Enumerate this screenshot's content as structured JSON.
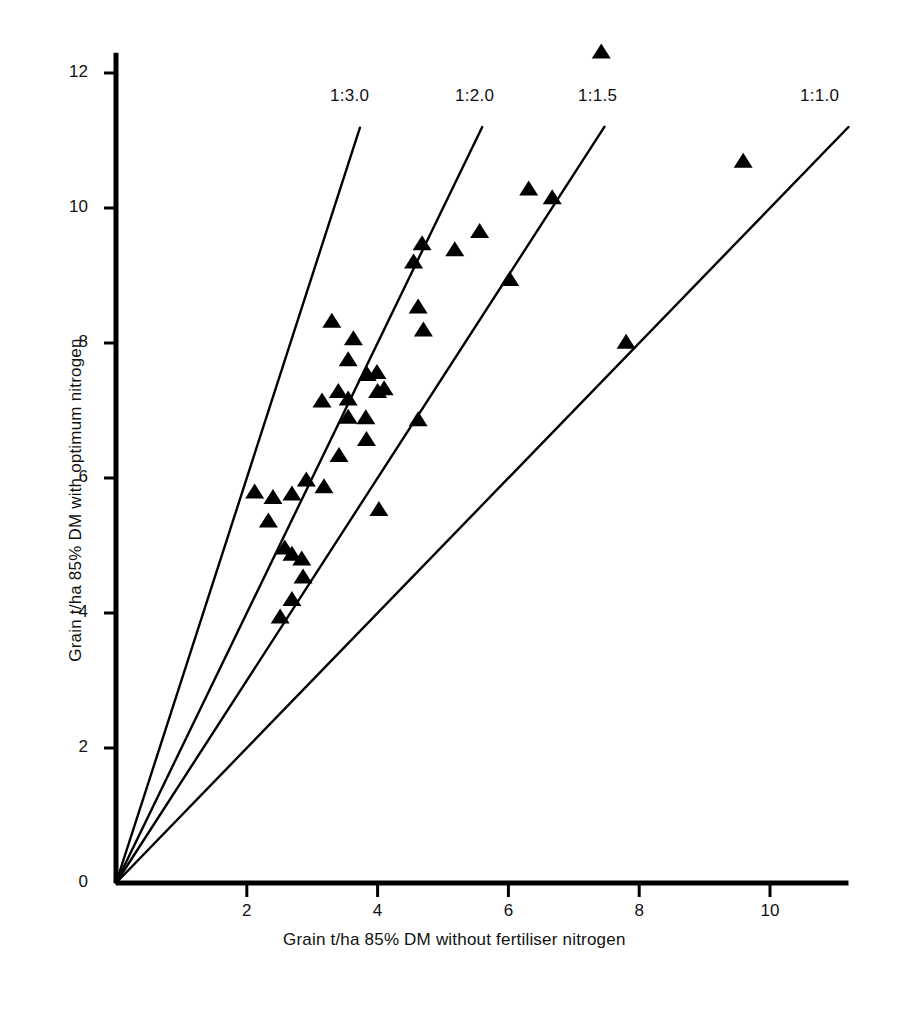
{
  "figure": {
    "background": "#ffffff",
    "ink_color": "#000000"
  },
  "axes": {
    "x_title": "Grain t/ha 85% DM without fertiliser nitrogen",
    "y_title": "Grain t/ha 85% DM with optimum nitrogen",
    "x_ticks": [
      "2",
      "4",
      "6",
      "8",
      "10"
    ],
    "y_ticks": [
      "0",
      "2",
      "4",
      "6",
      "8",
      "10",
      "12"
    ]
  },
  "ratio_labels": [
    {
      "text": "1:3.0",
      "x": 330,
      "y": 86
    },
    {
      "text": "1:2.0",
      "x": 455,
      "y": 86
    },
    {
      "text": "1:1.5",
      "x": 578,
      "y": 86
    },
    {
      "text": "1:1.0",
      "x": 800,
      "y": 86
    }
  ],
  "chart_data": {
    "type": "scatter",
    "title": "",
    "xlabel": "Grain t/ha 85% DM without fertiliser nitrogen",
    "ylabel": "Grain t/ha 85% DM with optimum nitrogen",
    "xlim": [
      0,
      11.2
    ],
    "ylim": [
      0,
      12.3
    ],
    "xticks": [
      2,
      4,
      6,
      8,
      10
    ],
    "yticks": [
      0,
      2,
      4,
      6,
      8,
      10,
      12
    ],
    "grid": false,
    "legend": "none",
    "marker": "triangle-up",
    "marker_color": "#000000",
    "series": [
      {
        "name": "sites",
        "points": [
          [
            7.42,
            12.3
          ],
          [
            9.59,
            10.68
          ],
          [
            6.31,
            10.27
          ],
          [
            6.67,
            10.14
          ],
          [
            4.68,
            9.46
          ],
          [
            5.18,
            9.37
          ],
          [
            5.56,
            9.64
          ],
          [
            4.55,
            9.19
          ],
          [
            6.02,
            8.93
          ],
          [
            4.62,
            8.52
          ],
          [
            4.7,
            8.18
          ],
          [
            3.3,
            8.31
          ],
          [
            3.63,
            8.05
          ],
          [
            3.55,
            7.74
          ],
          [
            3.99,
            7.55
          ],
          [
            3.84,
            7.52
          ],
          [
            4.1,
            7.31
          ],
          [
            4.0,
            7.27
          ],
          [
            3.55,
            7.16
          ],
          [
            3.4,
            7.27
          ],
          [
            3.15,
            7.13
          ],
          [
            3.55,
            6.89
          ],
          [
            3.82,
            6.88
          ],
          [
            3.83,
            6.56
          ],
          [
            4.62,
            6.85
          ],
          [
            3.41,
            6.32
          ],
          [
            2.91,
            5.96
          ],
          [
            3.18,
            5.86
          ],
          [
            4.02,
            5.52
          ],
          [
            2.12,
            5.78
          ],
          [
            2.4,
            5.7
          ],
          [
            2.69,
            5.75
          ],
          [
            2.33,
            5.35
          ],
          [
            2.58,
            4.95
          ],
          [
            2.69,
            4.86
          ],
          [
            2.84,
            4.79
          ],
          [
            2.86,
            4.52
          ],
          [
            2.69,
            4.19
          ],
          [
            2.51,
            3.93
          ],
          [
            7.8,
            8.0
          ]
        ]
      }
    ],
    "reference_lines": [
      {
        "label": "1:3.0",
        "slope": 3.0,
        "x_end": 3.73
      },
      {
        "label": "1:2.0",
        "slope": 2.0,
        "x_end": 5.6
      },
      {
        "label": "1:1.5",
        "slope": 1.5,
        "x_end": 7.47
      },
      {
        "label": "1:1.0",
        "slope": 1.0,
        "x_end": 11.2
      }
    ]
  }
}
